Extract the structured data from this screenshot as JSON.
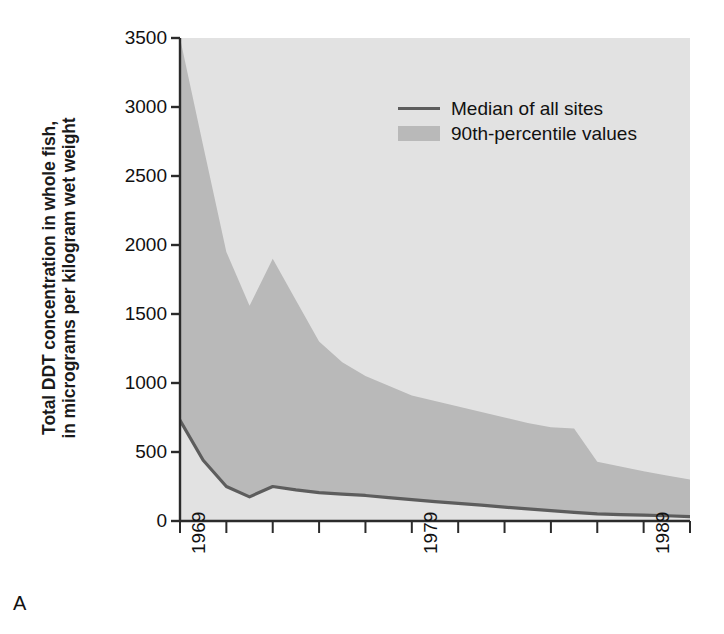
{
  "figure": {
    "panel_label": "A"
  },
  "axes": {
    "y_title_line1": "Total DDT concentration in whole fish,",
    "y_title_line2": "in micrograms per kilogram wet weight",
    "y_ticks": [
      "3500",
      "3000",
      "2500",
      "2000",
      "1500",
      "1000",
      "500",
      "0"
    ],
    "x_ticks_labeled": [
      "1969",
      "1979",
      "1989"
    ]
  },
  "legend": {
    "median_label": "Median of all sites",
    "band_label": "90th-percentile values"
  },
  "colors": {
    "band_fill": "#b9b9b9",
    "plot_background": "#e2e2e2",
    "median_line": "#5d5d5d",
    "axis": "#2b2b2b",
    "text": "#111111"
  },
  "chart_data": {
    "type": "area",
    "title": "",
    "xlabel": "",
    "ylabel": "Total DDT concentration in whole fish, in micrograms per kilogram wet weight",
    "xlim": [
      1969,
      1991
    ],
    "ylim": [
      0,
      3500
    ],
    "y_tick_step": 500,
    "x_tick_step": 2,
    "x_minor_tick_step": 2,
    "grid": false,
    "legend_position": "top-right",
    "x": [
      1969,
      1970,
      1971,
      1972,
      1973,
      1974,
      1975,
      1976,
      1977,
      1978,
      1979,
      1980,
      1981,
      1982,
      1983,
      1984,
      1985,
      1986,
      1987,
      1988,
      1989,
      1990,
      1991
    ],
    "series": [
      {
        "name": "90th-percentile values",
        "kind": "area",
        "values": [
          3500,
          2720,
          1950,
          1560,
          1900,
          1600,
          1300,
          1150,
          1050,
          980,
          910,
          870,
          830,
          790,
          750,
          710,
          680,
          670,
          430,
          395,
          360,
          330,
          300
        ]
      },
      {
        "name": "Median of all sites",
        "kind": "line",
        "values": [
          730,
          440,
          250,
          175,
          250,
          225,
          205,
          195,
          185,
          170,
          155,
          140,
          128,
          115,
          100,
          88,
          75,
          62,
          52,
          46,
          42,
          38,
          32
        ]
      }
    ],
    "area_baseline": 0
  }
}
